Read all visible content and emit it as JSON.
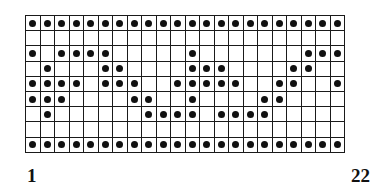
{
  "diagram": {
    "type": "knitting-chart-grid",
    "title": "",
    "columns": 22,
    "rows": 9,
    "symbols": {
      "filled": "dot",
      "empty": "blank"
    },
    "axis": {
      "start_label": "1",
      "end_label": "22"
    },
    "colors": {
      "grid_line": "#1a1a1a",
      "dot": "#111111",
      "cell_background": "#ffffff",
      "page_background": "#ffffff"
    },
    "grid": [
      [
        1,
        1,
        1,
        1,
        1,
        1,
        1,
        1,
        1,
        1,
        1,
        1,
        1,
        1,
        1,
        1,
        1,
        1,
        1,
        1,
        1,
        1
      ],
      [
        0,
        0,
        0,
        0,
        0,
        0,
        0,
        0,
        0,
        0,
        0,
        0,
        0,
        0,
        0,
        0,
        0,
        0,
        0,
        0,
        0,
        0
      ],
      [
        1,
        0,
        1,
        1,
        1,
        1,
        0,
        0,
        0,
        0,
        0,
        1,
        0,
        0,
        0,
        0,
        0,
        0,
        0,
        1,
        1,
        1
      ],
      [
        0,
        1,
        0,
        0,
        0,
        1,
        1,
        0,
        0,
        0,
        0,
        1,
        1,
        1,
        0,
        0,
        0,
        0,
        1,
        1,
        0,
        0
      ],
      [
        1,
        1,
        1,
        1,
        0,
        1,
        1,
        1,
        0,
        0,
        1,
        1,
        1,
        1,
        1,
        0,
        0,
        1,
        1,
        0,
        0,
        1
      ],
      [
        1,
        1,
        1,
        0,
        0,
        0,
        0,
        1,
        1,
        0,
        0,
        1,
        0,
        0,
        0,
        0,
        1,
        1,
        0,
        0,
        0,
        0
      ],
      [
        0,
        1,
        0,
        0,
        0,
        0,
        0,
        0,
        1,
        1,
        1,
        1,
        0,
        1,
        1,
        1,
        1,
        0,
        0,
        0,
        0,
        0
      ],
      [
        0,
        0,
        0,
        0,
        0,
        0,
        0,
        0,
        0,
        0,
        0,
        0,
        0,
        0,
        0,
        0,
        0,
        0,
        0,
        0,
        0,
        0
      ],
      [
        1,
        1,
        1,
        1,
        1,
        1,
        1,
        1,
        1,
        1,
        1,
        1,
        1,
        1,
        1,
        1,
        1,
        1,
        1,
        1,
        1,
        1
      ]
    ]
  }
}
